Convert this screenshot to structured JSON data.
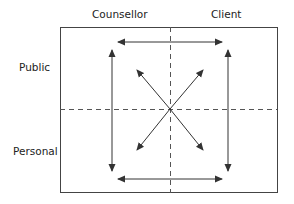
{
  "columns": {
    "left": "Counsellor",
    "right": "Client"
  },
  "rows": {
    "top": "Public",
    "bottom": "Personal"
  },
  "colors": {
    "line": "#333333",
    "dashed": "#555555"
  }
}
